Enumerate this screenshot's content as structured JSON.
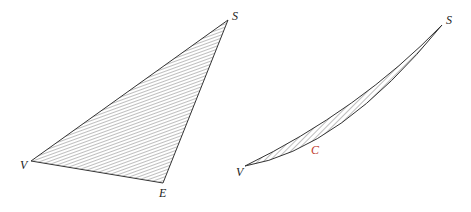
{
  "figures": [
    {
      "name": "triangle",
      "labels": {
        "V": "V",
        "S": "S",
        "E": "E"
      }
    },
    {
      "name": "lens",
      "labels": {
        "V": "V",
        "S": "S",
        "C": "C"
      }
    }
  ],
  "colors": {
    "stroke": "#333333",
    "accent_label": "#c0392b"
  }
}
